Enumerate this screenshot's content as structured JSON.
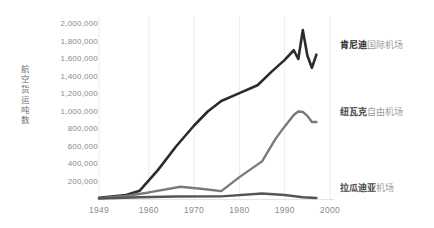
{
  "chart_data": {
    "type": "line",
    "title": "",
    "subtitle": "",
    "xlabel": "",
    "ylabel": "航空货运吨数",
    "xlim": [
      1949,
      2000
    ],
    "ylim": [
      0,
      2000000
    ],
    "grid": "vertical-only",
    "legend_position": "inline-right",
    "x_ticks": [
      "1949",
      "1960",
      "1970",
      "1980",
      "1990",
      "2000"
    ],
    "x_tick_values": [
      1949,
      1960,
      1970,
      1980,
      1990,
      2000
    ],
    "y_ticks": [
      "200,000",
      "400,000",
      "600,000",
      "800,000",
      "1,000,000",
      "1,200,000",
      "1,400,000",
      "1,600,000",
      "1,800,000",
      "2,000,000"
    ],
    "y_tick_values": [
      200000,
      400000,
      600000,
      800000,
      1000000,
      1200000,
      1400000,
      1600000,
      1800000,
      2000000
    ],
    "series": [
      {
        "name": "肯尼迪国际机场",
        "name_strong": "肯尼迪",
        "name_light": "国际机场",
        "color": "#2b2b2b",
        "width": 2.6,
        "label_y": 40,
        "x": [
          1949,
          1955,
          1958,
          1962,
          1966,
          1970,
          1973,
          1976,
          1980,
          1984,
          1987,
          1990,
          1992,
          1993,
          1994,
          1995,
          1996,
          1997
        ],
        "values": [
          15000,
          45000,
          95000,
          330000,
          600000,
          840000,
          1000000,
          1120000,
          1210000,
          1300000,
          1450000,
          1590000,
          1700000,
          1600000,
          1930000,
          1640000,
          1500000,
          1650000
        ]
      },
      {
        "name": "纽瓦克自由机场",
        "name_strong": "纽瓦克",
        "name_light": "自由机场",
        "color": "#7a7a7a",
        "width": 2.4,
        "label_y": 107,
        "x": [
          1949,
          1955,
          1960,
          1967,
          1972,
          1976,
          1980,
          1985,
          1988,
          1990,
          1992,
          1993,
          1994,
          1995,
          1996,
          1997
        ],
        "values": [
          8000,
          35000,
          75000,
          140000,
          115000,
          90000,
          250000,
          430000,
          690000,
          830000,
          960000,
          1000000,
          995000,
          950000,
          880000,
          880000
        ]
      },
      {
        "name": "拉瓜迪亚机场",
        "name_strong": "拉瓜迪亚",
        "name_light": "机场",
        "color": "#555555",
        "width": 2.4,
        "label_y": 183,
        "x": [
          1949,
          1958,
          1966,
          1976,
          1985,
          1990,
          1994,
          1997
        ],
        "values": [
          5000,
          20000,
          28000,
          30000,
          62000,
          45000,
          20000,
          12000
        ]
      }
    ]
  },
  "axis": {
    "y_title": "航空货运吨数"
  }
}
